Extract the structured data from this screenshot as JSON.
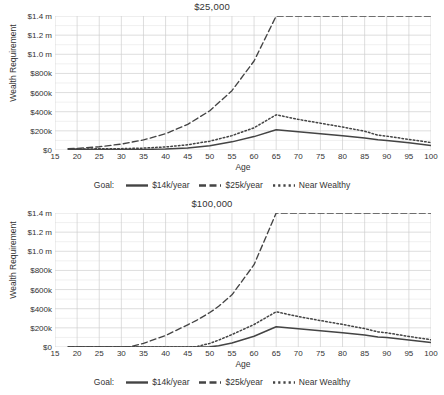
{
  "figure": {
    "ylabel": "Wealth Requirement",
    "xlabel": "Age",
    "legend_title": "Goal:"
  },
  "axis": {
    "yticks": [
      "$0",
      "$200k",
      "$400k",
      "$600k",
      "$800k",
      "$1.0 m",
      "$1.2 m",
      "$1.4 m"
    ],
    "xticks": [
      "15",
      "20",
      "25",
      "30",
      "35",
      "40",
      "45",
      "50",
      "55",
      "60",
      "65",
      "70",
      "75",
      "80",
      "85",
      "90",
      "95",
      "100"
    ]
  },
  "legend": {
    "items": [
      {
        "label": "$14k/year",
        "style": "solid",
        "color": "#444444"
      },
      {
        "label": "$25k/year",
        "style": "dashed",
        "color": "#444444"
      },
      {
        "label": "Near Wealthy",
        "style": "dotted",
        "color": "#444444"
      }
    ]
  },
  "colors": {
    "line": "#444444",
    "grid_major": "#cfcfcf",
    "grid_minor": "#e9e9e9",
    "text": "#333333",
    "background": "#ffffff"
  },
  "chart_data": {
    "type": "line",
    "xlabel": "Age",
    "ylabel": "Wealth Requirement",
    "xlim": [
      15,
      100
    ],
    "ylim": [
      0,
      1400000
    ],
    "ytick_values": [
      0,
      200000,
      400000,
      600000,
      800000,
      1000000,
      1200000,
      1400000
    ],
    "xtick_values": [
      15,
      20,
      25,
      30,
      35,
      40,
      45,
      50,
      55,
      60,
      65,
      70,
      75,
      80,
      85,
      90,
      95,
      100
    ],
    "grid": true,
    "legend_position": "below-axes",
    "legend_title": "Goal:",
    "panels": [
      {
        "title": "$25,000",
        "x": [
          18,
          20,
          25,
          30,
          35,
          40,
          45,
          50,
          55,
          60,
          65,
          70,
          75,
          80,
          85,
          88,
          90,
          95,
          100
        ],
        "series": [
          {
            "name": "$14k/year",
            "style": "solid",
            "values": [
              8000,
              8000,
              6000,
              5000,
              6000,
              11000,
              22000,
              45000,
              85000,
              140000,
              212000,
              190000,
              170000,
              148000,
              125000,
              108000,
              100000,
              75000,
              48000
            ]
          },
          {
            "name": "$25k/year",
            "style": "dashed",
            "values": [
              14000,
              17000,
              34000,
              62000,
              105000,
              170000,
              268000,
              410000,
              620000,
              930000,
              1400000,
              1400000,
              1400000,
              1400000,
              1400000,
              1400000,
              1400000,
              1400000,
              1400000
            ]
          },
          {
            "name": "Near Wealthy",
            "style": "dotted",
            "values": [
              10000,
              11000,
              12000,
              14000,
              20000,
              32000,
              55000,
              92000,
              150000,
              232000,
              368000,
              320000,
              280000,
              240000,
              196000,
              155000,
              145000,
              110000,
              78000
            ]
          }
        ]
      },
      {
        "title": "$100,000",
        "x": [
          18,
          20,
          25,
          30,
          32,
          35,
          40,
          45,
          47,
          50,
          52,
          55,
          60,
          65,
          70,
          75,
          80,
          85,
          88,
          90,
          95,
          100
        ],
        "series": [
          {
            "name": "$14k/year",
            "style": "solid",
            "values": [
              0,
              0,
              0,
              0,
              0,
              0,
              0,
              0,
              0,
              2000,
              12000,
              42000,
              112000,
              212000,
              190000,
              170000,
              148000,
              125000,
              105000,
              98000,
              74000,
              48000
            ]
          },
          {
            "name": "$25k/year",
            "style": "dashed",
            "values": [
              0,
              0,
              0,
              0,
              4000,
              38000,
              120000,
              232000,
              278000,
              360000,
              425000,
              545000,
              860000,
              1400000,
              1400000,
              1400000,
              1400000,
              1400000,
              1400000,
              1400000,
              1400000,
              1400000
            ]
          },
          {
            "name": "Near Wealthy",
            "style": "dotted",
            "values": [
              0,
              0,
              0,
              0,
              0,
              0,
              0,
              0,
              4000,
              38000,
              72000,
              130000,
              235000,
              368000,
              318000,
              276000,
              236000,
              192000,
              158000,
              148000,
              110000,
              76000
            ]
          }
        ]
      }
    ]
  }
}
